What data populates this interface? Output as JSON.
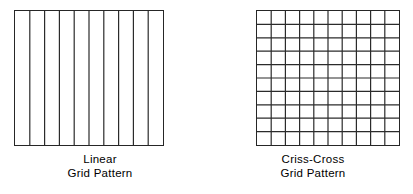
{
  "figure": {
    "background_color": "#ffffff",
    "line_color": "#2b2b2b",
    "text_color": "#000000"
  },
  "panels": [
    {
      "id": "linear",
      "pattern_type": "linear",
      "caption_line1": "Linear",
      "caption_line2": "Grid Pattern",
      "columns": 10,
      "rows": 1,
      "vertical_divider_count": 9,
      "horizontal_divider_count": 0
    },
    {
      "id": "crisscross",
      "pattern_type": "criss-cross",
      "caption_line1": "Criss-Cross",
      "caption_line2": "Grid Pattern",
      "columns": 10,
      "rows": 10,
      "vertical_divider_count": 9,
      "horizontal_divider_count": 9
    }
  ]
}
